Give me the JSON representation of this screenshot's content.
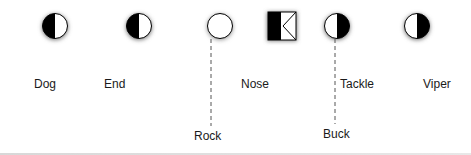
{
  "diagram": {
    "title": "",
    "symbols": [
      {
        "id": "dog",
        "label": "Dog",
        "shape": "circle",
        "fill": "left-half-black",
        "cx": 55,
        "cy": 26,
        "label_x": 34,
        "label_y": 77
      },
      {
        "id": "end",
        "label": "End",
        "shape": "circle",
        "fill": "left-half-black",
        "cx": 139,
        "cy": 26,
        "label_x": 104,
        "label_y": 77
      },
      {
        "id": "nose",
        "label": "Nose",
        "shape": "circle",
        "fill": "white",
        "cx": 220,
        "cy": 26,
        "label_x": 241,
        "label_y": 77
      },
      {
        "id": "key",
        "label": "",
        "shape": "square",
        "fill": "left-half-black-with-chevron",
        "cx": 282,
        "cy": 26
      },
      {
        "id": "tackle",
        "label": "Tackle",
        "shape": "circle",
        "fill": "right-half-black",
        "cx": 337,
        "cy": 26,
        "label_x": 340,
        "label_y": 77
      },
      {
        "id": "viper",
        "label": "Viper",
        "shape": "circle",
        "fill": "right-half-black",
        "cx": 417,
        "cy": 26,
        "label_x": 423,
        "label_y": 77
      }
    ],
    "leaders": [
      {
        "id": "rock",
        "label": "Rock",
        "from_x": 211,
        "from_y": 40,
        "to_y": 125,
        "label_x": 194,
        "label_y": 136
      },
      {
        "id": "buck",
        "label": "Buck",
        "from_x": 335,
        "from_y": 40,
        "to_y": 125,
        "label_x": 323,
        "label_y": 133
      }
    ],
    "colors": {
      "ink": "#000000",
      "text": "#1a1a1a",
      "leader": "#555555",
      "shadow": "#888888"
    }
  }
}
